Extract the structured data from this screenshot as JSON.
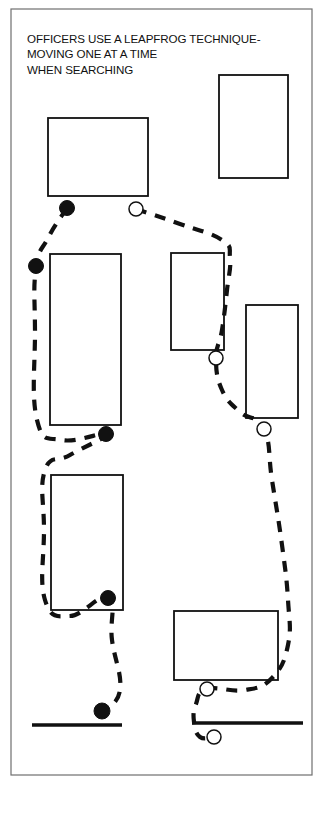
{
  "figure": {
    "title_lines": [
      "OFFICERS USE A LEAPFROG TECHNIQUE-",
      "MOVING ONE AT A TIME",
      "WHEN SEARCHING"
    ],
    "stroke_color": "#111111",
    "background_color": "#ffffff",
    "frame": {
      "x": 11,
      "y": 9,
      "width": 301,
      "height": 766,
      "stroke_width": 1.2
    }
  },
  "chart_data": {
    "type": "diagram",
    "title": "OFFICERS USE A LEAPFROG TECHNIQUE- MOVING ONE AT A TIME WHEN SEARCHING",
    "subtitle": "",
    "legend": [
      {
        "name": "officer-position-filled",
        "marker": "filled-circle",
        "count": 5
      },
      {
        "name": "officer-position-open",
        "marker": "open-circle",
        "count": 5
      }
    ],
    "buildings": [
      {
        "name": "building-top-left",
        "x": 48,
        "y": 118,
        "width": 100,
        "height": 78
      },
      {
        "name": "building-top-right",
        "x": 219,
        "y": 75,
        "width": 69,
        "height": 103
      },
      {
        "name": "building-mid-left",
        "x": 50,
        "y": 254,
        "width": 71,
        "height": 171
      },
      {
        "name": "building-mid-center",
        "x": 171,
        "y": 253,
        "width": 53,
        "height": 97
      },
      {
        "name": "building-mid-right",
        "x": 246,
        "y": 305,
        "width": 52,
        "height": 113
      },
      {
        "name": "building-lower-left",
        "x": 51,
        "y": 475,
        "width": 72,
        "height": 135
      },
      {
        "name": "building-bottom-right",
        "x": 174,
        "y": 611,
        "width": 104,
        "height": 69
      }
    ],
    "walls": [
      {
        "name": "wall-bottom-left",
        "x1": 32,
        "y1": 725,
        "x2": 122,
        "y2": 725
      },
      {
        "name": "wall-bottom-right",
        "x1": 192,
        "y1": 723,
        "x2": 303,
        "y2": 723
      }
    ],
    "routes": [
      {
        "name": "route-left-officer",
        "marker": "filled-circle",
        "points": [
          [
            67,
            208
          ],
          [
            48,
            238
          ],
          [
            36,
            268
          ],
          [
            35,
            330
          ],
          [
            37,
            420
          ],
          [
            62,
            440
          ],
          [
            106,
            434
          ],
          [
            70,
            455
          ],
          [
            45,
            470
          ],
          [
            44,
            530
          ],
          [
            45,
            600
          ],
          [
            70,
            616
          ],
          [
            108,
            598
          ],
          [
            112,
            640
          ],
          [
            120,
            690
          ],
          [
            102,
            712
          ]
        ]
      },
      {
        "name": "route-right-officer",
        "marker": "open-circle",
        "points": [
          [
            136,
            209
          ],
          [
            180,
            224
          ],
          [
            222,
            240
          ],
          [
            230,
            258
          ],
          [
            227,
            290
          ],
          [
            222,
            330
          ],
          [
            216,
            358
          ],
          [
            222,
            390
          ],
          [
            240,
            412
          ],
          [
            264,
            429
          ],
          [
            272,
            480
          ],
          [
            282,
            545
          ],
          [
            288,
            600
          ],
          [
            288,
            645
          ],
          [
            272,
            678
          ],
          [
            245,
            690
          ],
          [
            207,
            689
          ],
          [
            196,
            704
          ],
          [
            194,
            722
          ],
          [
            200,
            737
          ],
          [
            214,
            737
          ]
        ]
      }
    ],
    "markers": [
      {
        "name": "officer-filled-1",
        "type": "filled-circle",
        "x": 67,
        "y": 208,
        "r": 7.5
      },
      {
        "name": "officer-filled-2",
        "type": "filled-circle",
        "x": 36,
        "y": 266,
        "r": 7.5
      },
      {
        "name": "officer-filled-3",
        "type": "filled-circle",
        "x": 106,
        "y": 434,
        "r": 7.5
      },
      {
        "name": "officer-filled-4",
        "type": "filled-circle",
        "x": 108,
        "y": 598,
        "r": 7.5
      },
      {
        "name": "officer-filled-5",
        "type": "filled-circle",
        "x": 102,
        "y": 711,
        "r": 8.0
      },
      {
        "name": "officer-open-1",
        "type": "open-circle",
        "x": 136,
        "y": 209,
        "r": 7.0
      },
      {
        "name": "officer-open-2",
        "type": "open-circle",
        "x": 216,
        "y": 358,
        "r": 7.0
      },
      {
        "name": "officer-open-3",
        "type": "open-circle",
        "x": 264,
        "y": 429,
        "r": 7.0
      },
      {
        "name": "officer-open-4",
        "type": "open-circle",
        "x": 207,
        "y": 689,
        "r": 7.0
      },
      {
        "name": "officer-open-5",
        "type": "open-circle",
        "x": 214,
        "y": 737,
        "r": 7.0
      }
    ]
  }
}
